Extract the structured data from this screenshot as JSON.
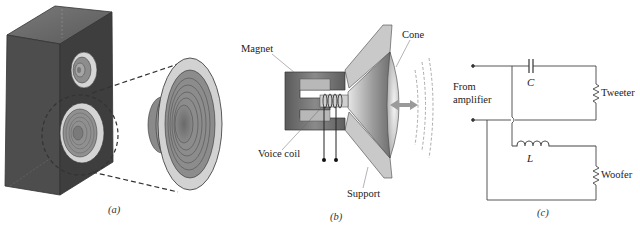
{
  "figure": {
    "panels": [
      {
        "id": "a",
        "caption": "(a)",
        "description": "Loudspeaker cabinet with tweeter and woofer; woofer shown enlarged"
      },
      {
        "id": "b",
        "caption": "(b)",
        "labels": {
          "magnet": "Magnet",
          "voice_coil": "Voice coil",
          "support": "Support",
          "cone": "Cone"
        }
      },
      {
        "id": "c",
        "caption": "(c)",
        "labels": {
          "source": "From",
          "source2": "amplifier",
          "capacitor": "C",
          "inductor": "L",
          "tweeter": "Tweeter",
          "woofer": "Woofer"
        }
      }
    ]
  },
  "colors": {
    "cabinet_side": "#4a4a4a",
    "cabinet_front": "#3c3c3c",
    "cabinet_top": "#6a6a6a",
    "driver_rim": "#d8d8d8",
    "magnet": "#6e6e6e",
    "support": "#c8c8c8",
    "line": "#333333"
  }
}
